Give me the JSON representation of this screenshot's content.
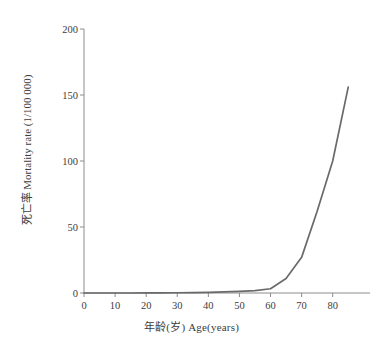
{
  "chart_data": {
    "type": "line",
    "title": "",
    "xlabel": "年龄(岁) Age(years)",
    "ylabel": "死亡率 Mortality rate (1/100 000)",
    "xlim": [
      0,
      92
    ],
    "ylim": [
      0,
      200
    ],
    "xticks": [
      0,
      10,
      20,
      30,
      40,
      50,
      60,
      70,
      80
    ],
    "yticks": [
      0,
      50,
      100,
      150,
      200
    ],
    "grid": false,
    "legend": "none",
    "line_color": "#6a6a6a",
    "series": [
      {
        "name": "Mortality rate",
        "x": [
          0,
          5,
          10,
          15,
          20,
          25,
          30,
          35,
          40,
          45,
          50,
          55,
          60,
          65,
          70,
          75,
          80,
          85
        ],
        "values": [
          0,
          0,
          0,
          0,
          0.1,
          0.1,
          0.2,
          0.3,
          0.5,
          0.8,
          1.2,
          1.8,
          3.2,
          11,
          27,
          62,
          100,
          156
        ]
      }
    ]
  },
  "axis": {
    "x_tick_labels": [
      "0",
      "10",
      "20",
      "30",
      "40",
      "50",
      "60",
      "70",
      "80"
    ],
    "y_tick_labels": [
      "0",
      "50",
      "100",
      "150",
      "200"
    ]
  }
}
